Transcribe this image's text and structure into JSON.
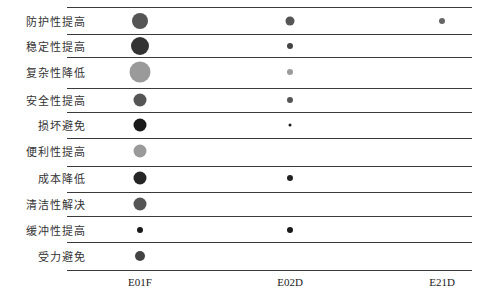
{
  "chart_data": {
    "type": "scatter",
    "subtype": "bubble-matrix",
    "title": "",
    "xlabel": "",
    "ylabel": "",
    "categories_x": [
      "E01F",
      "E02D",
      "E21D"
    ],
    "categories_y": [
      "防护性提高",
      "稳定性提高",
      "复杂性降低",
      "安全性提高",
      "损坏避免",
      "便利性提高",
      "成本降低",
      "清洁性解决",
      "缓冲性提高",
      "受力避免"
    ],
    "grid": "horizontal-lines",
    "legend": "none",
    "points": [
      {
        "x": "E01F",
        "y": "防护性提高",
        "size": 16,
        "color": "#555555"
      },
      {
        "x": "E01F",
        "y": "稳定性提高",
        "size": 18,
        "color": "#333333"
      },
      {
        "x": "E01F",
        "y": "复杂性降低",
        "size": 21,
        "color": "#9a9a9a"
      },
      {
        "x": "E01F",
        "y": "安全性提高",
        "size": 13,
        "color": "#555555"
      },
      {
        "x": "E01F",
        "y": "损坏避免",
        "size": 13,
        "color": "#1a1a1a"
      },
      {
        "x": "E01F",
        "y": "便利性提高",
        "size": 13,
        "color": "#9a9a9a"
      },
      {
        "x": "E01F",
        "y": "成本降低",
        "size": 13,
        "color": "#262626"
      },
      {
        "x": "E01F",
        "y": "清洁性解决",
        "size": 13,
        "color": "#555555"
      },
      {
        "x": "E01F",
        "y": "缓冲性提高",
        "size": 6,
        "color": "#1a1a1a"
      },
      {
        "x": "E01F",
        "y": "受力避免",
        "size": 10,
        "color": "#444444"
      },
      {
        "x": "E02D",
        "y": "防护性提高",
        "size": 9,
        "color": "#555555"
      },
      {
        "x": "E02D",
        "y": "稳定性提高",
        "size": 6,
        "color": "#444444"
      },
      {
        "x": "E02D",
        "y": "复杂性降低",
        "size": 6,
        "color": "#9a9a9a"
      },
      {
        "x": "E02D",
        "y": "安全性提高",
        "size": 6,
        "color": "#555555"
      },
      {
        "x": "E02D",
        "y": "损坏避免",
        "size": 3,
        "color": "#1a1a1a"
      },
      {
        "x": "E02D",
        "y": "成本降低",
        "size": 6,
        "color": "#222222"
      },
      {
        "x": "E02D",
        "y": "缓冲性提高",
        "size": 6,
        "color": "#1a1a1a"
      },
      {
        "x": "E21D",
        "y": "防护性提高",
        "size": 6,
        "color": "#666666"
      }
    ]
  },
  "layout": {
    "col_x": {
      "E01F": 140,
      "E02D": 290,
      "E21D": 442
    },
    "row_y": [
      21,
      46,
      72,
      100,
      125,
      151,
      178,
      204,
      230,
      256
    ],
    "line_y": [
      7,
      34,
      57,
      88,
      112,
      138,
      166,
      192,
      216,
      242,
      270
    ]
  }
}
